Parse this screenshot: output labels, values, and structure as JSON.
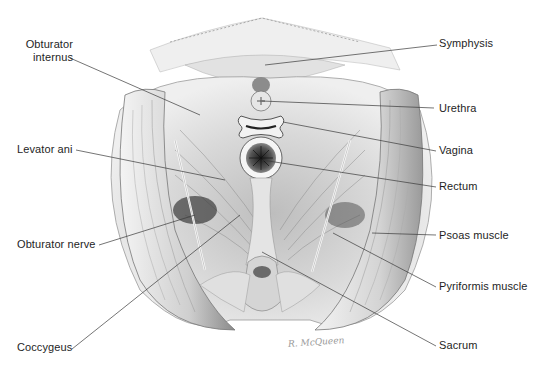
{
  "figure": {
    "signature": "R. McQueen",
    "colors": {
      "background": "#ffffff",
      "label_text": "#1e1e1e",
      "leader_line": "#3a3a3a",
      "ink": "#555555"
    }
  },
  "labels": {
    "left": [
      {
        "id": "obturator-internus",
        "text_line1": "Obturator",
        "text_line2": "internus"
      },
      {
        "id": "levator-ani",
        "text": "Levator ani"
      },
      {
        "id": "obturator-nerve",
        "text": "Obturator nerve"
      },
      {
        "id": "coccygeus",
        "text": "Coccygeus"
      }
    ],
    "right": [
      {
        "id": "symphysis",
        "text": "Symphysis"
      },
      {
        "id": "urethra",
        "text": "Urethra"
      },
      {
        "id": "vagina",
        "text": "Vagina"
      },
      {
        "id": "rectum",
        "text": "Rectum"
      },
      {
        "id": "psoas-muscle",
        "text": "Psoas muscle"
      },
      {
        "id": "pyriformis-muscle",
        "text": "Pyriformis muscle"
      },
      {
        "id": "sacrum",
        "text": "Sacrum"
      }
    ]
  }
}
